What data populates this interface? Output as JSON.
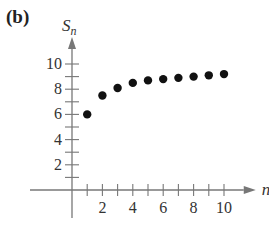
{
  "panel_label": "(b)",
  "chart_data": {
    "type": "scatter",
    "title": "",
    "xlabel": "n",
    "ylabel": "S_n",
    "xlim": [
      0,
      11
    ],
    "ylim": [
      0,
      11
    ],
    "x_ticks": [
      1,
      2,
      3,
      4,
      5,
      6,
      7,
      8,
      9,
      10
    ],
    "x_tick_labels": [
      "2",
      "4",
      "6",
      "8",
      "10"
    ],
    "y_ticks": [
      1,
      2,
      3,
      4,
      5,
      6,
      7,
      8,
      9,
      10
    ],
    "y_tick_labels": [
      "2",
      "4",
      "6",
      "8",
      "10"
    ],
    "grid": false,
    "legend": null,
    "series": [
      {
        "name": "S_n",
        "x": [
          1,
          2,
          3,
          4,
          5,
          6,
          7,
          8,
          9,
          10
        ],
        "values": [
          6.0,
          7.5,
          8.1,
          8.5,
          8.7,
          8.8,
          8.9,
          9.0,
          9.1,
          9.2
        ]
      }
    ],
    "colors": {
      "points": "#111111",
      "axis": "#777777",
      "text": "#333333"
    }
  }
}
